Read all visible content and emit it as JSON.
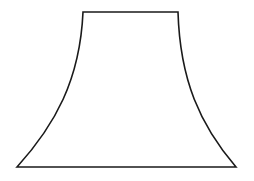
{
  "figure": {
    "background_color": "#ffffff",
    "stroke_color": "#1a1a1a",
    "shape": {
      "top_left": [
        83,
        12
      ],
      "top_right": [
        178,
        12
      ],
      "bottom_right": [
        236,
        167
      ],
      "bottom_left": [
        17,
        167
      ],
      "path": "M83 12 L178 12 C180 80 200 125 236 167 L17 167 C55 125 80 80 83 12 Z"
    }
  }
}
